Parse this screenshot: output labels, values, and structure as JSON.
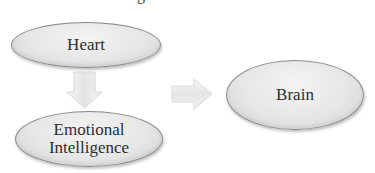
{
  "title_fragment": "g",
  "nodes": {
    "heart": {
      "label": "Heart"
    },
    "emotional_intelligence": {
      "line1": "Emotional",
      "line2": "Intelligence"
    },
    "brain": {
      "label": "Brain"
    }
  },
  "connectors": [
    {
      "from": "Heart",
      "to": "Emotional Intelligence",
      "direction": "down"
    },
    {
      "from": "Emotional Intelligence",
      "to": "Brain",
      "direction": "right"
    }
  ],
  "colors": {
    "node_fill": "#e6e6e6",
    "node_border": "#8a8a8a",
    "arrow_fill": "#ececec",
    "text": "#2e2e2e"
  }
}
